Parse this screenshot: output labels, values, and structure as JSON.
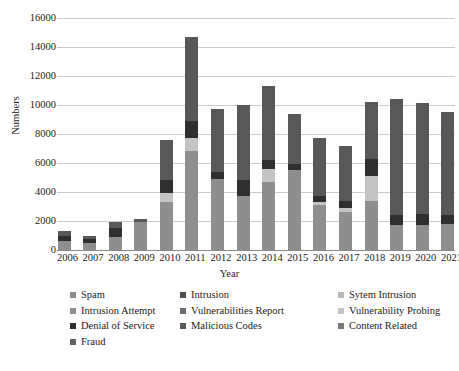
{
  "chart_data": {
    "type": "bar",
    "stacked": true,
    "title": "",
    "xlabel": "Year",
    "ylabel": "Numbers",
    "ylim": [
      0,
      16000
    ],
    "ytick_step": 2000,
    "yticks": [
      "16000",
      "14000",
      "12000",
      "10000",
      "8000",
      "6000",
      "4000",
      "2000",
      "0"
    ],
    "grid": true,
    "legend_position": "bottom",
    "categories": [
      "2006",
      "2007",
      "2008",
      "2009",
      "2010",
      "2011",
      "2012",
      "2013",
      "2014",
      "2015",
      "2016",
      "2017",
      "2018",
      "2019",
      "2020",
      "2021"
    ],
    "series": [
      {
        "name": "Spam",
        "color": "#8c8c8c",
        "values": [
          0,
          0,
          0,
          0,
          0,
          0,
          0,
          0,
          0,
          0,
          0,
          0,
          0,
          0,
          0,
          0
        ]
      },
      {
        "name": "Intrusion",
        "color": "#4f4f4f",
        "values": [
          0,
          0,
          0,
          0,
          0,
          0,
          0,
          0,
          0,
          0,
          0,
          0,
          0,
          0,
          0,
          0
        ]
      },
      {
        "name": "Sytem Intrusion",
        "color": "#b8b8b8",
        "values": [
          0,
          0,
          0,
          0,
          0,
          0,
          0,
          0,
          0,
          0,
          0,
          0,
          0,
          0,
          0,
          0
        ]
      },
      {
        "name": "Intrusion Attempt",
        "color": "#8e8e8e",
        "values": [
          650,
          500,
          900,
          1900,
          3300,
          6800,
          4900,
          3700,
          4700,
          5500,
          3100,
          2600,
          3400,
          1700,
          1750,
          1800
        ]
      },
      {
        "name": "Vulnerabilities Report",
        "color": "#6d6d6d",
        "values": [
          0,
          0,
          0,
          0,
          0,
          0,
          0,
          0,
          0,
          0,
          0,
          0,
          0,
          0,
          0,
          0
        ]
      },
      {
        "name": "Vulnerability Probing",
        "color": "#c4c4c4",
        "values": [
          0,
          0,
          0,
          0,
          600,
          900,
          0,
          0,
          900,
          0,
          200,
          300,
          1700,
          0,
          0,
          0
        ]
      },
      {
        "name": "Denial of Service",
        "color": "#2f2f2f",
        "values": [
          350,
          250,
          650,
          0,
          900,
          1200,
          450,
          1100,
          600,
          400,
          400,
          500,
          1200,
          700,
          700,
          600
        ]
      },
      {
        "name": "Malicious Codes",
        "color": "#585858",
        "values": [
          300,
          200,
          350,
          250,
          2800,
          5800,
          4400,
          5200,
          5100,
          3500,
          4000,
          3800,
          3900,
          8000,
          7700,
          7100
        ]
      },
      {
        "name": "Content Related",
        "color": "#7a7a7a",
        "values": [
          0,
          0,
          0,
          0,
          0,
          0,
          0,
          0,
          0,
          0,
          0,
          0,
          0,
          0,
          0,
          0
        ]
      },
      {
        "name": "Fraud",
        "color": "#636363",
        "values": [
          0,
          0,
          0,
          0,
          0,
          0,
          0,
          0,
          0,
          0,
          0,
          0,
          0,
          0,
          0,
          0
        ]
      }
    ],
    "totals": [
      1300,
      950,
      1900,
      2150,
      7600,
      14700,
      9750,
      10000,
      11300,
      9400,
      7700,
      7200,
      10200,
      10400,
      10150,
      9500
    ]
  },
  "legend": {
    "rows": [
      [
        {
          "label": "Spam",
          "color": "#8c8c8c"
        },
        {
          "label": "Intrusion",
          "color": "#4f4f4f"
        },
        {
          "label": "Sytem Intrusion",
          "color": "#b8b8b8"
        }
      ],
      [
        {
          "label": "Intrusion Attempt",
          "color": "#8e8e8e"
        },
        {
          "label": "Vulnerabilities Report",
          "color": "#6d6d6d"
        },
        {
          "label": "Vulnerability Probing",
          "color": "#c4c4c4"
        }
      ],
      [
        {
          "label": "Denial of Service",
          "color": "#2f2f2f"
        },
        {
          "label": "Malicious Codes",
          "color": "#585858"
        },
        {
          "label": "Content Related",
          "color": "#7a7a7a"
        }
      ],
      [
        {
          "label": "Fraud",
          "color": "#636363"
        }
      ]
    ]
  }
}
